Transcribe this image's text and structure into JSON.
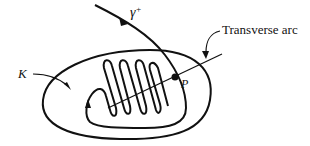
{
  "diagram": {
    "labels": {
      "gamma": "γ",
      "gamma_sup": "+",
      "transverse_arc": "Transverse arc",
      "region": "K",
      "point": "P"
    },
    "elements": [
      {
        "name": "region-K",
        "type": "closed-curve",
        "description": "oval boundary of region K"
      },
      {
        "name": "trajectory-gamma-plus",
        "type": "curve",
        "description": "positive semi-orbit entering K and spiraling in zigzag"
      },
      {
        "name": "transverse-arc",
        "type": "line-segment",
        "description": "arc transverse to the flow passing through P"
      },
      {
        "name": "point-P",
        "type": "point",
        "description": "intersection of trajectory with transverse arc"
      }
    ],
    "colors": {
      "stroke": "#111111",
      "background": "#ffffff"
    }
  }
}
